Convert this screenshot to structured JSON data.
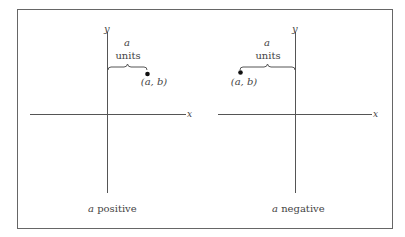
{
  "figure": {
    "panels": [
      {
        "id": "left",
        "caption_var": "a",
        "caption_text": " positive",
        "y_label": "y",
        "x_label": "x",
        "brace_label_top": "a",
        "brace_label_bottom": "units",
        "point_label": "(a, b)"
      },
      {
        "id": "right",
        "caption_var": "a",
        "caption_text": " negative",
        "y_label": "y",
        "x_label": "x",
        "brace_label_top": "a",
        "brace_label_bottom": "units",
        "point_label": "(a, b)"
      }
    ],
    "colors": {
      "line": "#555555",
      "text": "#444444",
      "point": "#111111"
    }
  }
}
